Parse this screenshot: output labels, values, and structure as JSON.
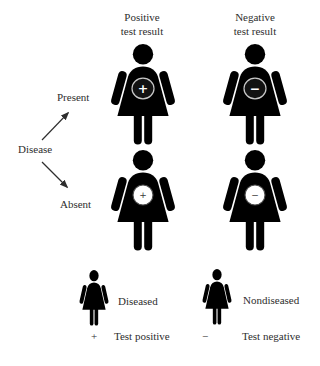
{
  "colors": {
    "diseased_fill": "#7a7a7a",
    "outline_color": "#4d4d4d",
    "badge_fill": "#121212",
    "badge_ring": "#c8c8c8",
    "text_color": "#2e2e2e",
    "bg": "#ffffff"
  },
  "columns": [
    {
      "line1": "Positive",
      "line2": "test result"
    },
    {
      "line1": "Negative",
      "line2": "test result"
    }
  ],
  "tree": {
    "root": "Disease",
    "branches": [
      "Present",
      "Absent"
    ]
  },
  "grid": {
    "cells": [
      {
        "disease": "Present",
        "test": "Positive test result",
        "figure": "diseased",
        "symbol": "+"
      },
      {
        "disease": "Present",
        "test": "Negative test result",
        "figure": "diseased",
        "symbol": "−"
      },
      {
        "disease": "Absent",
        "test": "Positive test result",
        "figure": "nondiseased",
        "symbol": "+"
      },
      {
        "disease": "Absent",
        "test": "Negative test result",
        "figure": "nondiseased",
        "symbol": "−"
      }
    ]
  },
  "legend": {
    "figures": [
      {
        "figure": "diseased",
        "label": "Diseased"
      },
      {
        "figure": "nondiseased",
        "label": "Nondiseased"
      }
    ],
    "symbols": [
      {
        "symbol": "+",
        "label": "Test positive"
      },
      {
        "symbol": "−",
        "label": "Test negative"
      }
    ]
  }
}
